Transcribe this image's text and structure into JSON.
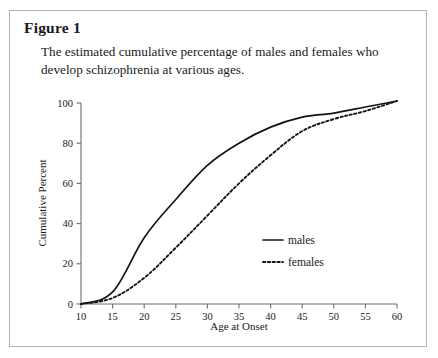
{
  "figure": {
    "title": "Figure 1",
    "caption": "The estimated cumulative percentage of males and females who develop schizophrenia at various ages."
  },
  "colors": {
    "line": "#141414",
    "axis": "#6e6e6e",
    "frame": "#b4b4b4",
    "background": "#ffffff"
  },
  "chart_data": {
    "type": "line",
    "title": "",
    "xlabel": "Age at Onset",
    "ylabel": "Cumulative Percent",
    "xlim": [
      10,
      60
    ],
    "ylim": [
      0,
      100
    ],
    "xticks": [
      10,
      15,
      20,
      25,
      30,
      35,
      40,
      45,
      50,
      55,
      60
    ],
    "yticks": [
      0,
      20,
      40,
      60,
      80,
      100
    ],
    "grid": false,
    "legend_position": "center-right",
    "x": [
      10,
      15,
      20,
      25,
      30,
      35,
      40,
      45,
      50,
      55,
      60
    ],
    "series": [
      {
        "name": "males",
        "style": "solid",
        "values": [
          0,
          6,
          33,
          52,
          69,
          80,
          88,
          93,
          95,
          98,
          101
        ]
      },
      {
        "name": "females",
        "style": "dotted",
        "values": [
          0,
          3,
          13,
          28,
          44,
          60,
          74,
          86,
          92,
          96,
          101
        ]
      }
    ]
  }
}
